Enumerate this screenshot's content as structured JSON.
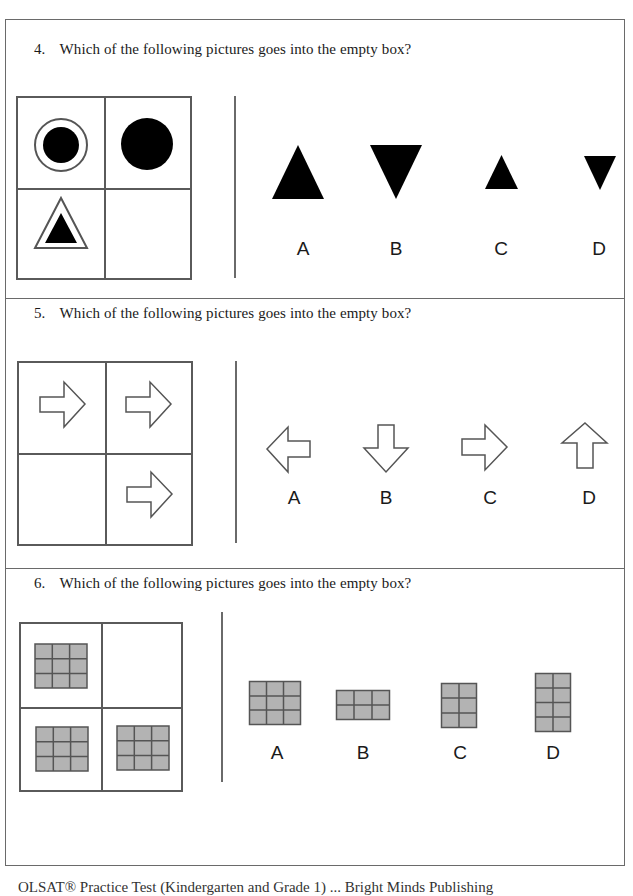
{
  "questions": [
    {
      "number": "4.",
      "text": "Which of the following pictures goes into the empty box?",
      "matrix": [
        {
          "position": "top-left",
          "content": "small black circle inside outlined circle"
        },
        {
          "position": "top-right",
          "content": "large black circle"
        },
        {
          "position": "bottom-left",
          "content": "small black triangle inside outlined triangle"
        },
        {
          "position": "bottom-right",
          "content": "empty"
        }
      ],
      "options": [
        {
          "label": "A",
          "content": "large black upward triangle"
        },
        {
          "label": "B",
          "content": "large black downward triangle"
        },
        {
          "label": "C",
          "content": "small black upward triangle"
        },
        {
          "label": "D",
          "content": "small black downward triangle"
        }
      ]
    },
    {
      "number": "5.",
      "text": "Which of the following pictures goes into the empty box?",
      "matrix": [
        {
          "position": "top-left",
          "content": "outlined right arrow"
        },
        {
          "position": "top-right",
          "content": "outlined right arrow"
        },
        {
          "position": "bottom-left",
          "content": "empty"
        },
        {
          "position": "bottom-right",
          "content": "outlined right arrow"
        }
      ],
      "options": [
        {
          "label": "A",
          "content": "outlined left arrow"
        },
        {
          "label": "B",
          "content": "outlined down arrow"
        },
        {
          "label": "C",
          "content": "outlined right arrow"
        },
        {
          "label": "D",
          "content": "outlined up arrow"
        }
      ]
    },
    {
      "number": "6.",
      "text": "Which of the following pictures goes into the empty box?",
      "matrix": [
        {
          "position": "top-left",
          "content": "gray grid 3x3"
        },
        {
          "position": "top-right",
          "content": "empty"
        },
        {
          "position": "bottom-left",
          "content": "gray grid 3x3"
        },
        {
          "position": "bottom-right",
          "content": "gray grid 3x3"
        }
      ],
      "options": [
        {
          "label": "A",
          "content": "gray grid 3 columns x 3 rows"
        },
        {
          "label": "B",
          "content": "gray grid 3 columns x 2 rows"
        },
        {
          "label": "C",
          "content": "gray grid 2 columns x 3 rows"
        },
        {
          "label": "D",
          "content": "gray grid 2 columns x 4 rows"
        }
      ]
    }
  ],
  "footer": {
    "text": "OLSAT® Practice Test (Kindergarten and Grade 1) ... Bright Minds Publishing",
    "note": "bottom line partially cut off"
  },
  "colors": {
    "line": "#5a5a5a",
    "shape_fill": "#000000",
    "grid_fill": "#b3b3b3",
    "grid_stroke": "#555555"
  }
}
